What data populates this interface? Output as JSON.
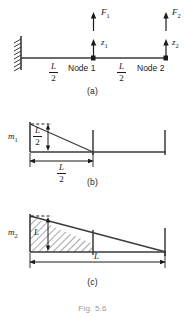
{
  "figure": {
    "caption_bottom": "Fig. 5.6",
    "panels": [
      {
        "id": "a",
        "caption": "(a)",
        "labels": {
          "force1": "F",
          "force1_sub": "1",
          "force2": "F",
          "force2_sub": "2",
          "dof1": "z",
          "dof1_sub": "1",
          "dof2": "z",
          "dof2_sub": "2",
          "node1": "Node 1",
          "node2": "Node 2",
          "span1_num": "L",
          "span1_den": "2",
          "span2_num": "L",
          "span2_den": "2"
        }
      },
      {
        "id": "b",
        "caption": "(b)",
        "labels": {
          "moment": "m",
          "moment_sub": "1",
          "height_num": "L",
          "height_den": "2",
          "length_num": "L",
          "length_den": "2"
        }
      },
      {
        "id": "c",
        "caption": "(c)",
        "labels": {
          "moment": "m",
          "moment_sub": "2",
          "height": "L",
          "length": "L"
        }
      }
    ],
    "colors": {
      "line": "#3a3a3a",
      "text": "#1b1b1b",
      "caption_faint": "#9a9a9a"
    }
  }
}
